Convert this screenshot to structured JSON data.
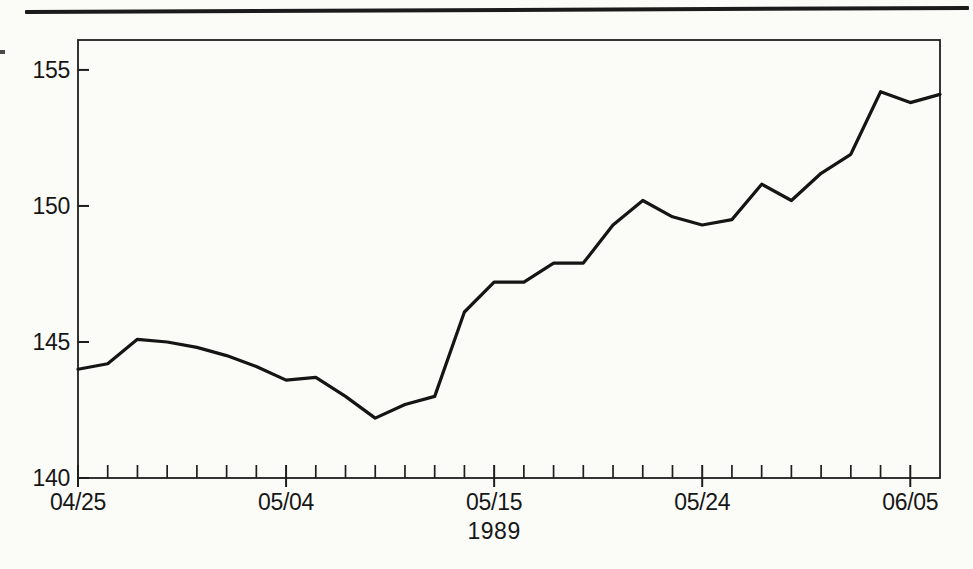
{
  "page": {
    "background": "#fbfbf8",
    "top_rule_color": "#1b1b1b"
  },
  "chart_data": {
    "type": "line",
    "title": "",
    "xlabel": "1989",
    "ylabel": "",
    "legend": "none",
    "grid": false,
    "line_color": "#151515",
    "axis_color": "#1e1e1e",
    "text_color": "#161616",
    "ylim": [
      140,
      156.1
    ],
    "y_ticks": [
      140,
      145,
      150,
      155
    ],
    "x_major_ticks": [
      {
        "index": 0,
        "label": "04/25"
      },
      {
        "index": 7,
        "label": "05/04"
      },
      {
        "index": 14,
        "label": "05/15"
      },
      {
        "index": 21,
        "label": "05/24"
      },
      {
        "index": 28,
        "label": "06/05"
      }
    ],
    "x": [
      "04/25",
      "04/26",
      "04/27",
      "04/28",
      "05/01",
      "05/02",
      "05/03",
      "05/04",
      "05/05",
      "05/08",
      "05/09",
      "05/10",
      "05/11",
      "05/12",
      "05/15",
      "05/16",
      "05/17",
      "05/18",
      "05/19",
      "05/22",
      "05/23",
      "05/24",
      "05/25",
      "05/26",
      "05/30",
      "05/31",
      "06/01",
      "06/02",
      "06/05",
      "06/06"
    ],
    "series": [
      {
        "name": "daily-rate",
        "values": [
          144.0,
          144.2,
          145.1,
          145.0,
          144.8,
          144.5,
          144.1,
          143.6,
          143.7,
          143.0,
          142.2,
          142.7,
          143.0,
          146.1,
          147.2,
          147.2,
          147.9,
          147.9,
          149.3,
          150.2,
          149.6,
          149.3,
          149.5,
          150.8,
          150.2,
          151.2,
          151.9,
          154.2,
          153.8,
          154.1
        ]
      }
    ]
  }
}
